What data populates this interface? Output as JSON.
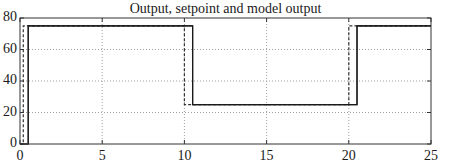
{
  "chart_data": {
    "type": "line",
    "title": "Output, setpoint and model output",
    "xlabel": "",
    "ylabel": "",
    "xlim": [
      0,
      25
    ],
    "ylim": [
      0,
      80
    ],
    "grid": true,
    "legend": null,
    "xticks": [
      0,
      5,
      10,
      15,
      20,
      25
    ],
    "yticks": [
      0,
      20,
      40,
      60,
      80
    ],
    "xtick_labels": [
      "0",
      "5",
      "10",
      "15",
      "20",
      "25"
    ],
    "ytick_labels": [
      "0",
      "20",
      "40",
      "60",
      "80"
    ],
    "series": [
      {
        "name": "Setpoint",
        "style": "dashed",
        "color": "#333333",
        "x": [
          0,
          0.2,
          0.2,
          10.0,
          10.0,
          20.0,
          20.0,
          25
        ],
        "y": [
          0,
          0,
          75,
          75,
          25,
          25,
          75,
          75
        ]
      },
      {
        "name": "Output",
        "style": "solid",
        "color": "#1a1a1a",
        "x": [
          0,
          0.5,
          0.5,
          10.5,
          10.5,
          20.5,
          20.5,
          25
        ],
        "y": [
          0,
          0,
          75,
          75,
          25,
          25,
          75,
          75
        ]
      },
      {
        "name": "Model output",
        "style": "solid",
        "color": "#1a1a1a",
        "x": [
          0,
          0.5,
          0.5,
          10.5,
          10.5,
          20.5,
          20.5,
          25
        ],
        "y": [
          0,
          0,
          75,
          75,
          25,
          25,
          75,
          75
        ]
      }
    ]
  },
  "layout": {
    "plot": {
      "left": 20,
      "right": 431,
      "top": 18,
      "bottom": 144
    },
    "axis_color": "#333333",
    "grid_color": "#888888"
  }
}
